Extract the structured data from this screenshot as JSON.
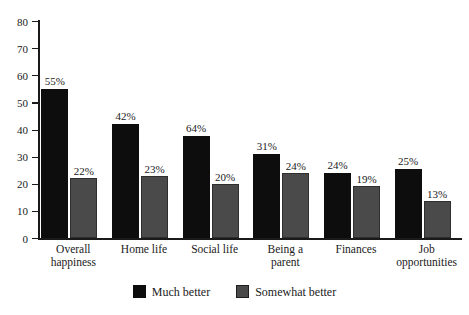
{
  "chart_data": {
    "type": "bar",
    "title": "",
    "xlabel": "",
    "ylabel": "",
    "ylim": [
      0,
      80
    ],
    "yticks": [
      0,
      10,
      20,
      30,
      40,
      50,
      60,
      70,
      80
    ],
    "grid": false,
    "legend_position": "bottom-center",
    "categories": [
      "Overall happiness",
      "Home life",
      "Social life",
      "Being a parent",
      "Finances",
      "Job opportunities"
    ],
    "category_lines": [
      [
        "Overall",
        "happiness"
      ],
      [
        "Home life"
      ],
      [
        "Social life"
      ],
      [
        "Being a",
        "parent"
      ],
      [
        "Finances"
      ],
      [
        "Job",
        "opportunities"
      ]
    ],
    "series": [
      {
        "name": "Much better",
        "color": "#0d0d0d",
        "labels": [
          "55%",
          "42%",
          "64%",
          "31%",
          "24%",
          "25%"
        ],
        "values": [
          55,
          42,
          37.5,
          31,
          24,
          25.5
        ]
      },
      {
        "name": "Somewhat better",
        "color": "#4a4a4a",
        "labels": [
          "22%",
          "23%",
          "20%",
          "24%",
          "19%",
          "13%"
        ],
        "values": [
          22,
          23,
          20,
          24,
          19,
          13.5
        ]
      }
    ]
  },
  "legend": {
    "items": [
      {
        "label": "Much better",
        "swatch": "much"
      },
      {
        "label": "Somewhat better",
        "swatch": "somewhat"
      }
    ]
  }
}
